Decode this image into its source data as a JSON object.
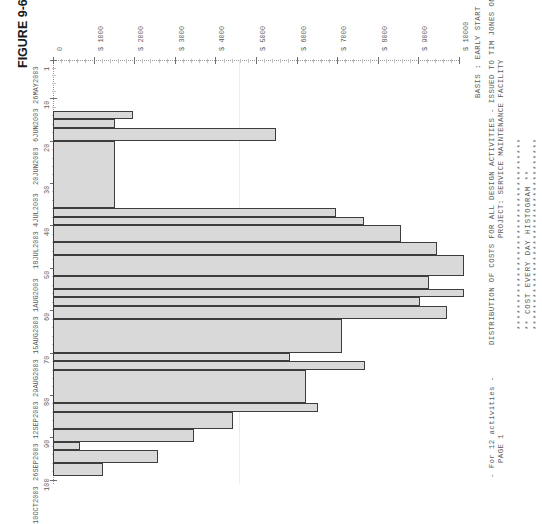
{
  "figure": {
    "caption": "FIGURE 9-6"
  },
  "header": {
    "line1": "PROJECT: SERVICE MAINTENANCE FACILITY",
    "line2": "DISTRIBUTION OF COSTS FOR ALL DESIGN ACTIVITIES - ISSUED TO TIM JONES ON 4/15/2003",
    "line3": "BASIS : EARLY START",
    "stars_top": "************************************",
    "stars_title": "**   COST  EVERY  DAY  HISTOGRAM   **",
    "stars_bottom": "************************************",
    "page": "PAGE 1",
    "activities": "- For 12 activities -"
  },
  "chart_data": {
    "type": "bar",
    "orientation": "rotated-landscape",
    "title": "COST EVERY DAY HISTOGRAM",
    "subtitle": "DISTRIBUTION OF COSTS FOR ALL DESIGN ACTIVITIES",
    "xlabel": "Day / Date",
    "ylabel": "Cost ($)",
    "ylim": [
      0,
      10000
    ],
    "grid": false,
    "legend": "none",
    "ytick_labels": [
      "0",
      "$ 1000",
      "$ 2000",
      "$ 3000",
      "$ 4000",
      "$ 5000",
      "$ 6000",
      "$ 7000",
      "$ 8000",
      "$ 9000",
      "$ 10000"
    ],
    "ytick_values": [
      0,
      1000,
      2000,
      3000,
      4000,
      5000,
      6000,
      7000,
      8000,
      9000,
      10000
    ],
    "xtick_numbers": [
      "1",
      "10",
      "20",
      "30",
      "40",
      "50",
      "60",
      "70",
      "80",
      "90",
      "100"
    ],
    "xtick_dates": [
      "26MAY2003",
      "6JUN2003",
      "20JUN2003",
      "4JUL2003",
      "18JUL2003",
      "1AUG2003",
      "15AUG2003",
      "29AUG2003",
      "12SEP2003",
      "26SEP2003",
      "10OCT2003"
    ],
    "xtick_positions": [
      1,
      10,
      20,
      30,
      40,
      50,
      60,
      70,
      80,
      90,
      100
    ],
    "bars": [
      {
        "start_day": 13,
        "end_day": 15,
        "value": 5100
      },
      {
        "start_day": 15,
        "end_day": 17,
        "value": 4000
      },
      {
        "start_day": 17,
        "end_day": 20,
        "value": 14300
      },
      {
        "start_day": 20,
        "end_day": 36,
        "value": 4000
      },
      {
        "start_day": 36,
        "end_day": 38,
        "value": 18100
      },
      {
        "start_day": 38,
        "end_day": 40,
        "value": 19900
      },
      {
        "start_day": 40,
        "end_day": 44,
        "value": 22300
      },
      {
        "start_day": 44,
        "end_day": 47,
        "value": 24600
      },
      {
        "start_day": 47,
        "end_day": 52,
        "value": 26300
      },
      {
        "start_day": 52,
        "end_day": 55,
        "value": 24100
      },
      {
        "start_day": 55,
        "end_day": 57,
        "value": 26300
      },
      {
        "start_day": 57,
        "end_day": 59,
        "value": 23500
      },
      {
        "start_day": 59,
        "end_day": 62,
        "value": 25200
      },
      {
        "start_day": 62,
        "end_day": 70,
        "value": 18500
      },
      {
        "start_day": 70,
        "end_day": 72,
        "value": 15200
      },
      {
        "start_day": 72,
        "end_day": 74,
        "value": 20000
      },
      {
        "start_day": 74,
        "end_day": 82,
        "value": 16200
      },
      {
        "start_day": 82,
        "end_day": 84,
        "value": 17000
      },
      {
        "start_day": 84,
        "end_day": 88,
        "value": 11500
      },
      {
        "start_day": 88,
        "end_day": 91,
        "value": 9000
      },
      {
        "start_day": 91,
        "end_day": 93,
        "value": 1700
      },
      {
        "start_day": 93,
        "end_day": 96,
        "value": 6700
      },
      {
        "start_day": 96,
        "end_day": 99,
        "value": 3200
      }
    ]
  }
}
